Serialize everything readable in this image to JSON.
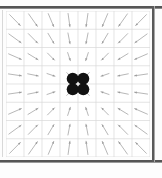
{
  "figure": {
    "title": "",
    "kind": "vector-field-quiver-plot",
    "frame_color": "#555555",
    "background_color": "#ffffff"
  },
  "plot": {
    "grid": {
      "visible": true,
      "color": "#d9d9d9",
      "columns": 8,
      "rows": 8,
      "x_lines": [
        0,
        18,
        36,
        54,
        72,
        90,
        108,
        126,
        144
      ],
      "y_lines": [
        0,
        18.25,
        36.5,
        54.75,
        73,
        91.25,
        109.5,
        127.75,
        146
      ]
    },
    "arrow_color": "#aaaaaa",
    "arrow_head_color": "#9a9a9a",
    "marker": {
      "name": "center-cluster",
      "color": "#111111",
      "count": 4,
      "arrangement": "2x2",
      "radius": 6,
      "center_x": 72,
      "center_y": 73
    }
  },
  "chart_data": {
    "type": "scatter",
    "xlabel": "",
    "ylabel": "",
    "xlim": [
      -4,
      4
    ],
    "ylim": [
      -4,
      4
    ],
    "grid": true,
    "legend": false,
    "annotations": [
      "arrows point inward toward the origin",
      "four black markers at the origin"
    ],
    "markers": {
      "x": [
        -0.15,
        0.15,
        -0.15,
        0.15
      ],
      "y": [
        0.15,
        0.15,
        -0.15,
        -0.15
      ],
      "color": "#111111",
      "size": 12
    },
    "quiver": {
      "x": [
        -3.5,
        -2.5,
        -1.5,
        -0.5,
        0.5,
        1.5,
        2.5,
        3.5
      ],
      "y": [
        3.5,
        2.5,
        1.5,
        0.5,
        -0.5,
        -1.5,
        -2.5,
        -3.5
      ],
      "rule": "u = -x/r, v = -y/r (unit vectors pointing to origin)",
      "scale": 0.85
    }
  }
}
